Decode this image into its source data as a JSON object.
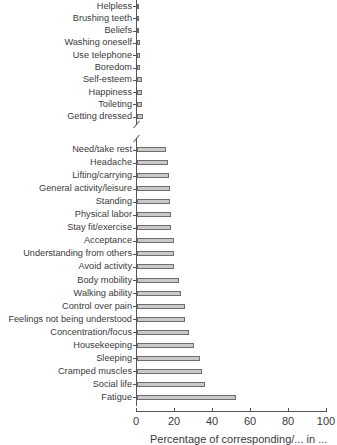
{
  "chart_data": {
    "type": "bar",
    "orientation": "horizontal",
    "title": "",
    "xlabel": "Percentage of corresponding/... (partially cut off)",
    "ylabel": "",
    "xlim": [
      0,
      100
    ],
    "x_ticks": [
      0,
      20,
      40,
      60,
      80,
      100
    ],
    "axis_break": true,
    "grid": false,
    "legend": null,
    "bar_color": "#c9c9c9",
    "bar_edge_color": "#6e6e6e",
    "sections": [
      {
        "name": "upper",
        "categories": [
          "Helpless",
          "Brushing teeth",
          "Beliefs",
          "Washing oneself",
          "Use telephone",
          "Boredom",
          "Self-esteem",
          "Happiness",
          "Toileting",
          "Getting dressed"
        ],
        "values": [
          0.5,
          1,
          1,
          1.5,
          1.5,
          1.5,
          2.5,
          2.5,
          2.5,
          3
        ]
      },
      {
        "name": "lower",
        "categories": [
          "Need/take rest",
          "Headache",
          "Lifting/carrying",
          "General activity/leisure",
          "Standing",
          "Physical labor",
          "Stay fit/exercise",
          "Acceptance",
          "Understanding from others",
          "Avoid activity",
          "Body mobility",
          "Walking ability",
          "Control over pain",
          "Feelings not being understood",
          "Concentration/focus",
          "Housekeeping",
          "Sleeping",
          "Cramped muscles",
          "Social life",
          "Fatigue"
        ],
        "values": [
          15,
          16.5,
          17,
          17.5,
          17.5,
          18,
          18,
          19.5,
          19.5,
          19.5,
          22,
          23,
          25,
          25,
          27.5,
          30,
          33,
          34,
          36,
          52
        ]
      }
    ]
  },
  "axis": {
    "tick_labels": [
      "0",
      "20",
      "40",
      "60",
      "80",
      "100"
    ],
    "xlabel_visible": "Percentage of corresponding/... in ..."
  }
}
